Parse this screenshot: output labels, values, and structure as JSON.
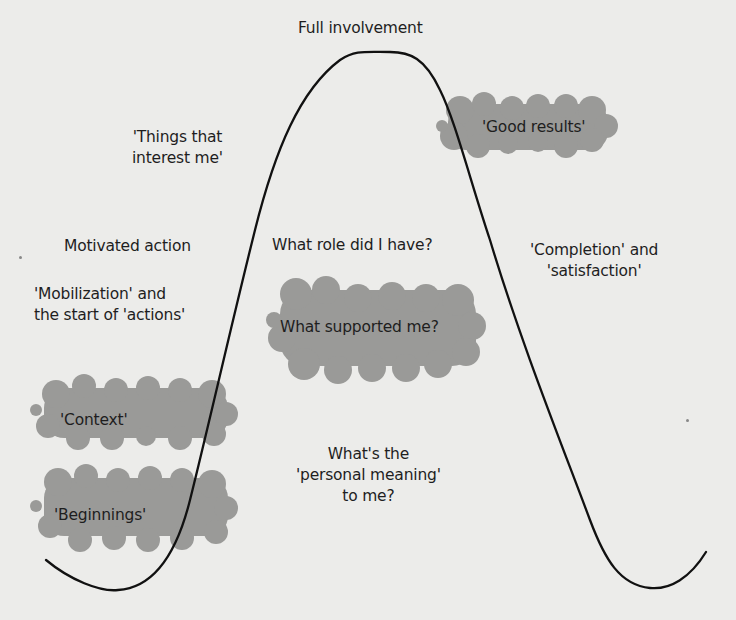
{
  "diagram": {
    "type": "involvement-curve",
    "colors": {
      "background": "#ececea",
      "curve": "#111111",
      "cloud": "#9a9a98",
      "text": "#1e1e1e"
    },
    "peak_label": "Full involvement",
    "labels": {
      "things_interest": [
        "'Things that",
        "interest me'"
      ],
      "motivated_action": "Motivated action",
      "mobilization": [
        "'Mobilization' and",
        "the start of 'actions'"
      ],
      "what_role": "What role did I have?",
      "completion": [
        "'Completion' and",
        "'satisfaction'"
      ],
      "personal_meaning": [
        "What's the",
        "'personal meaning'",
        "to me?"
      ]
    },
    "highlighted": {
      "good_results": "'Good results'",
      "what_supported": "What supported me?",
      "context": "'Context'",
      "beginnings": "'Beginnings'"
    }
  }
}
